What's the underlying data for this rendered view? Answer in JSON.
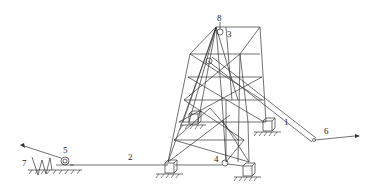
{
  "diagram": {
    "type": "mechanical schematic - tower erection with gin pole",
    "labels": [
      {
        "id": "1",
        "text": "1",
        "x": 286,
        "y": 122
      },
      {
        "id": "2",
        "text": "2",
        "x": 130,
        "y": 156
      },
      {
        "id": "3",
        "text": "3",
        "x": 229,
        "y": 33
      },
      {
        "id": "4",
        "text": "4",
        "x": 215,
        "y": 158
      },
      {
        "id": "5",
        "text": "5",
        "x": 64,
        "y": 149
      },
      {
        "id": "6",
        "text": "6",
        "x": 325,
        "y": 130
      },
      {
        "id": "7",
        "text": "7",
        "x": 23,
        "y": 162
      },
      {
        "id": "8",
        "text": "8",
        "x": 220,
        "y": 17
      }
    ],
    "colors": {
      "line": "#333333",
      "background": "#ffffff"
    }
  }
}
